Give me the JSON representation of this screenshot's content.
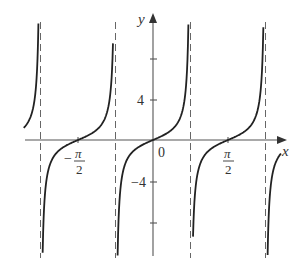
{
  "chart_data": {
    "type": "line",
    "title": "",
    "function": "y = tan(2x)",
    "xlabel": "x",
    "ylabel": "y",
    "x_tick_labels": [
      "-π/2",
      "0",
      "π/2"
    ],
    "x_ticks": [
      -1.5708,
      0,
      1.5708
    ],
    "y_tick_labels": [
      "4",
      "-4"
    ],
    "y_ticks": [
      -8,
      -4,
      4,
      8
    ],
    "asymptotes_x": [
      -2.356,
      -0.785,
      0.785,
      2.356
    ],
    "xlim": [
      -2.6,
      2.8
    ],
    "ylim": [
      -11.2,
      12.3
    ],
    "grid": false,
    "legend": null,
    "series": [
      {
        "name": "branch 1",
        "x_range": [
          -2.74,
          -2.37
        ]
      },
      {
        "name": "branch 2",
        "x_range": [
          -2.33,
          -0.8
        ]
      },
      {
        "name": "branch 3",
        "x_range": [
          -0.77,
          0.77
        ]
      },
      {
        "name": "branch 4",
        "x_range": [
          0.8,
          2.33
        ]
      },
      {
        "name": "branch 5",
        "x_range": [
          2.38,
          2.68
        ]
      }
    ],
    "colors": {
      "curve": "#222222",
      "axis": "#555555",
      "asymptote": "#666666"
    }
  },
  "labels": {
    "x_axis": "x",
    "y_axis": "y",
    "origin": "0",
    "y_pos4": "4",
    "y_neg4": "−4",
    "neg_pi_num": "π",
    "neg_pi_den": "2",
    "neg_sign": "−",
    "pos_pi_num": "π",
    "pos_pi_den": "2"
  }
}
